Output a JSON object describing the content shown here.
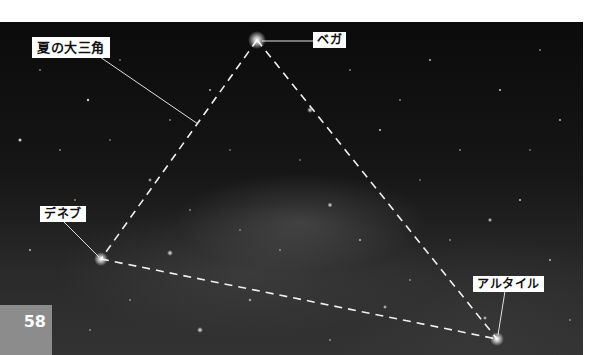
{
  "figure": {
    "title_label": "夏の大三角",
    "stars": [
      {
        "name": "ベガ",
        "x": 257,
        "y": 40
      },
      {
        "name": "デネブ",
        "x": 101,
        "y": 259
      },
      {
        "name": "アルタイル",
        "x": 497,
        "y": 339
      }
    ]
  },
  "page": {
    "number": "58",
    "number_box_color": "#8c8c8c"
  },
  "colors": {
    "sky": "#111111",
    "label_bg": "#ffffff",
    "line": "#e8e8e8"
  }
}
